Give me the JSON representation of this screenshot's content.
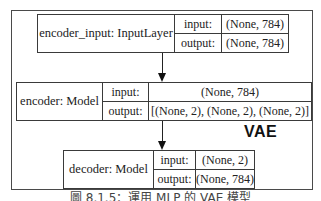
{
  "diagram": {
    "group_label": "VAE",
    "nodes": [
      {
        "name": "encoder_input: InputLayer",
        "input_label": "input:",
        "input_value": "(None, 784)",
        "output_label": "output:",
        "output_value": "(None, 784)"
      },
      {
        "name": "encoder: Model",
        "input_label": "input:",
        "input_value": "(None, 784)",
        "output_label": "output:",
        "output_value": "[(None, 2), (None, 2), (None, 2)]"
      },
      {
        "name": "decoder: Model",
        "input_label": "input:",
        "input_value": "(None, 2)",
        "output_label": "output:",
        "output_value": "(None, 784)"
      }
    ],
    "edges": [
      {
        "from": "encoder_input: InputLayer",
        "to": "encoder: Model"
      },
      {
        "from": "encoder: Model",
        "to": "decoder: Model"
      }
    ],
    "caption": "圖 8.1.5：運用 MLP 的 VAE 模型"
  }
}
